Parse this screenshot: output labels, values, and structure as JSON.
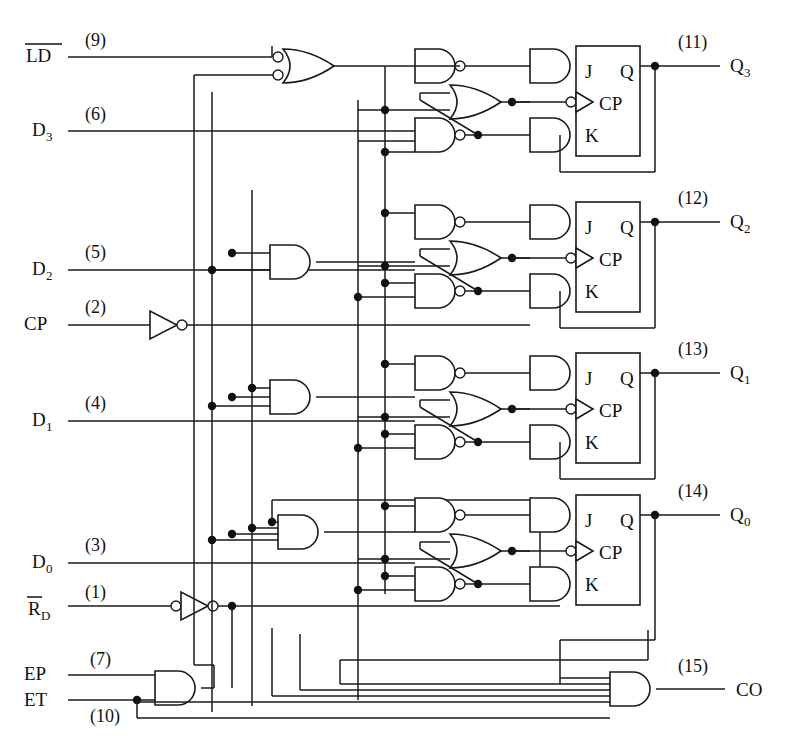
{
  "diagram": {
    "type": "logic-schematic"
  },
  "inputs": [
    {
      "name": "LD",
      "label": "LD",
      "overbar": true,
      "pin": "(9)",
      "sub": ""
    },
    {
      "name": "D3",
      "label": "D",
      "overbar": false,
      "pin": "(6)",
      "sub": "3"
    },
    {
      "name": "D2",
      "label": "D",
      "overbar": false,
      "pin": "(5)",
      "sub": "2"
    },
    {
      "name": "CP",
      "label": "CP",
      "overbar": false,
      "pin": "(2)",
      "sub": ""
    },
    {
      "name": "D1",
      "label": "D",
      "overbar": false,
      "pin": "(4)",
      "sub": "1"
    },
    {
      "name": "D0",
      "label": "D",
      "overbar": false,
      "pin": "(3)",
      "sub": "0"
    },
    {
      "name": "RD",
      "label": "R",
      "overbar": true,
      "pin": "(1)",
      "sub": "D"
    },
    {
      "name": "EP",
      "label": "EP",
      "overbar": false,
      "pin": "(7)",
      "sub": ""
    },
    {
      "name": "ET",
      "label": "ET",
      "overbar": false,
      "pin": "(10)",
      "sub": ""
    }
  ],
  "outputs": [
    {
      "name": "Q3",
      "label": "Q",
      "sub": "3",
      "pin": "(11)"
    },
    {
      "name": "Q2",
      "label": "Q",
      "sub": "2",
      "pin": "(12)"
    },
    {
      "name": "Q1",
      "label": "Q",
      "sub": "1",
      "pin": "(13)"
    },
    {
      "name": "Q0",
      "label": "Q",
      "sub": "0",
      "pin": "(14)"
    },
    {
      "name": "CO",
      "label": "CO",
      "sub": "",
      "pin": "(15)"
    }
  ],
  "flipflops": [
    {
      "name": "ff-q3",
      "j": "J",
      "cp": "CP",
      "k": "K",
      "q": "Q"
    },
    {
      "name": "ff-q2",
      "j": "J",
      "cp": "CP",
      "k": "K",
      "q": "Q"
    },
    {
      "name": "ff-q1",
      "j": "J",
      "cp": "CP",
      "k": "K",
      "q": "Q"
    },
    {
      "name": "ff-q0",
      "j": "J",
      "cp": "CP",
      "k": "K",
      "q": "Q"
    }
  ],
  "gates": {
    "load_or": {
      "type": "or",
      "inputs": 2,
      "input_bubbles": true
    },
    "cp_inverter": {
      "type": "inverter",
      "output_bubble": true
    },
    "rd_inverter": {
      "type": "inverter",
      "input_bubble": true,
      "output_bubble": true
    },
    "enable_and": {
      "type": "and",
      "inputs": 2
    },
    "carry_and": {
      "type": "and",
      "inputs": 5
    },
    "stage_and_inputs": [
      4,
      3,
      2,
      1
    ]
  },
  "colors": {
    "line": "#1a1a1a",
    "background": "#ffffff",
    "text": "#111111"
  }
}
